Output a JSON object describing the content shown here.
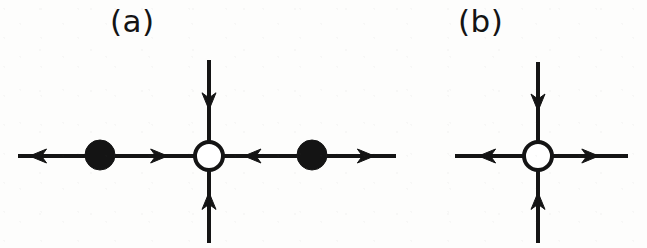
{
  "figure": {
    "width": 647,
    "height": 248,
    "background_color": "#fdfdfc",
    "ink_color": "#141414",
    "node_fill_open": "#ffffff",
    "node_fill_closed": "#141414",
    "stroke_width": 4,
    "arrow_head_length": 17,
    "arrow_head_halfwidth": 7
  },
  "panels": [
    {
      "id": "panel-a",
      "label": "(a)",
      "label_x": 110,
      "label_y": 6,
      "axis_y": 156,
      "nodes": [
        {
          "id": "node-a-left-filled",
          "type": "filled",
          "cx": 100,
          "cy": 155,
          "r": 15
        },
        {
          "id": "node-a-center-open",
          "type": "open",
          "cx": 209,
          "cy": 156,
          "r": 14
        },
        {
          "id": "node-a-right-filled",
          "type": "filled",
          "cx": 312,
          "cy": 155,
          "r": 15
        }
      ],
      "arms": [
        {
          "id": "arm-a-far-left",
          "orientation": "horizontal",
          "x1": 18,
          "y1": 156,
          "x2": 86,
          "y2": 156,
          "head_at": 0.42,
          "direction": "left"
        },
        {
          "id": "arm-a-left-inner",
          "orientation": "horizontal",
          "x1": 115,
          "y1": 156,
          "x2": 196,
          "y2": 156,
          "head_at": 0.44,
          "direction": "right"
        },
        {
          "id": "arm-a-right-inner",
          "orientation": "horizontal",
          "x1": 297,
          "y1": 156,
          "x2": 222,
          "y2": 156,
          "head_at": 0.48,
          "direction": "left"
        },
        {
          "id": "arm-a-far-right",
          "orientation": "horizontal",
          "x1": 327,
          "y1": 156,
          "x2": 396,
          "y2": 156,
          "head_at": 0.44,
          "direction": "right"
        },
        {
          "id": "arm-a-top",
          "orientation": "vertical",
          "x1": 209,
          "y1": 60,
          "x2": 209,
          "y2": 142,
          "head_at": 0.4,
          "direction": "down"
        },
        {
          "id": "arm-a-bottom",
          "orientation": "vertical",
          "x1": 209,
          "y1": 243,
          "x2": 209,
          "y2": 170,
          "head_at": 0.46,
          "direction": "up"
        }
      ]
    },
    {
      "id": "panel-b",
      "label": "(b)",
      "label_x": 458,
      "label_y": 6,
      "axis_y": 156,
      "nodes": [
        {
          "id": "node-b-center-open",
          "type": "open",
          "cx": 538,
          "cy": 156,
          "r": 14
        }
      ],
      "arms": [
        {
          "id": "arm-b-left",
          "orientation": "horizontal",
          "x1": 455,
          "y1": 156,
          "x2": 525,
          "y2": 156,
          "head_at": 0.58,
          "direction": "left"
        },
        {
          "id": "arm-b-right",
          "orientation": "horizontal",
          "x1": 551,
          "y1": 156,
          "x2": 628,
          "y2": 156,
          "head_at": 0.4,
          "direction": "right"
        },
        {
          "id": "arm-b-top",
          "orientation": "vertical",
          "x1": 538,
          "y1": 62,
          "x2": 538,
          "y2": 142,
          "head_at": 0.4,
          "direction": "down"
        },
        {
          "id": "arm-b-bottom",
          "orientation": "vertical",
          "x1": 538,
          "y1": 243,
          "x2": 538,
          "y2": 170,
          "head_at": 0.46,
          "direction": "up"
        }
      ]
    }
  ]
}
